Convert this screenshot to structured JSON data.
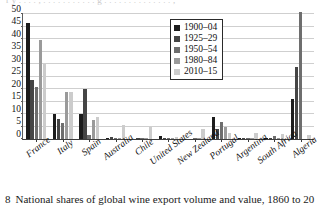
{
  "top_bleed_text": "r y  . . . .  , . . .  . . . . . .  . . g . . . . . .  . . .  . . . . . ,",
  "caption": {
    "figure_number": "8",
    "text": "National shares of global wine export volume and value, 1860 to 20"
  },
  "legend": {
    "position": "upper-right",
    "entries": [
      {
        "label": "1900–04",
        "color": "#1c1c1c"
      },
      {
        "label": "1925–29",
        "color": "#454545"
      },
      {
        "label": "1950–54",
        "color": "#6e6e6e"
      },
      {
        "label": "1980–84",
        "color": "#9a9a9a"
      },
      {
        "label": "2010–15",
        "color": "#cccccc"
      }
    ]
  },
  "chart_data": {
    "type": "bar",
    "title": "",
    "subtitle": "",
    "xlabel": "",
    "ylabel": "",
    "ylim": [
      0,
      50
    ],
    "yticks": [
      0,
      5,
      10,
      15,
      20,
      25,
      30,
      35,
      40,
      45,
      50
    ],
    "ytick_labels": [
      "0",
      "5",
      "10",
      "15",
      "20",
      "25",
      "30",
      "35",
      "40",
      "45",
      "50"
    ],
    "grid": true,
    "grid_axis": "y",
    "legend_position": "upper-right",
    "categories": [
      "France",
      "Italy",
      "Spain",
      "Australia",
      "Chile",
      "United States",
      "New Zealand",
      "Portugal",
      "Argentina",
      "South Africa",
      "Algeria"
    ],
    "series": [
      {
        "name": "1900–04",
        "color": "#1c1c1c",
        "values": [
          46.5,
          10.0,
          10.0,
          0.2,
          0.0,
          1.2,
          0.0,
          8.8,
          0.1,
          0.1,
          16.0
        ]
      },
      {
        "name": "1925–29",
        "color": "#454545",
        "values": [
          23.5,
          8.0,
          20.2,
          0.8,
          0.2,
          0.2,
          0.0,
          4.2,
          0.3,
          0.3,
          28.7
        ]
      },
      {
        "name": "1950–54",
        "color": "#6e6e6e",
        "values": [
          21.0,
          6.5,
          1.5,
          0.5,
          0.2,
          0.6,
          0.1,
          7.0,
          0.4,
          1.2,
          51.0
        ]
      },
      {
        "name": "1980–84",
        "color": "#9a9a9a",
        "values": [
          39.5,
          19.0,
          7.5,
          0.3,
          0.3,
          0.2,
          0.2,
          4.8,
          0.3,
          0.4,
          0.0
        ]
      },
      {
        "name": "2010–15",
        "color": "#cccccc",
        "values": [
          30.0,
          19.0,
          9.0,
          5.7,
          5.0,
          0.9,
          4.2,
          2.5,
          2.6,
          2.1,
          1.7
        ]
      }
    ]
  }
}
